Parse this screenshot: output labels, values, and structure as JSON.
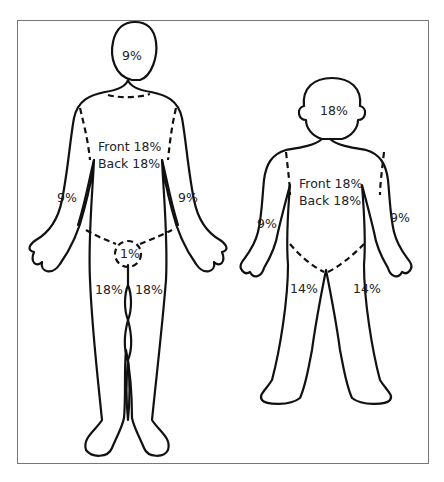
{
  "diagram": {
    "type": "rule-of-nines-burn-chart",
    "adult": {
      "head": "9%",
      "trunk_front": "Front 18%",
      "trunk_back": "Back 18%",
      "left_arm": "9%",
      "right_arm": "9%",
      "genitals": "1%",
      "left_leg": "18%",
      "right_leg": "18%"
    },
    "child": {
      "head": "18%",
      "trunk_front": "Front 18%",
      "trunk_back": "Back 18%",
      "left_arm": "9%",
      "right_arm": "9%",
      "left_leg": "14%",
      "right_leg": "14%"
    }
  }
}
